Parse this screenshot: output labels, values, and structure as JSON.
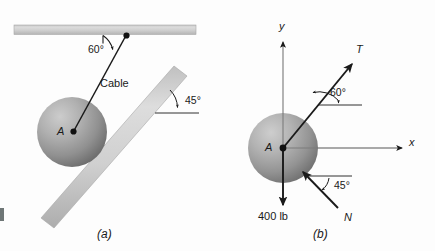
{
  "figure": {
    "background_color": "#fdfdfd",
    "ink_color": "#1a1a1a",
    "bar_fill_light": "#d8d8d8",
    "bar_fill_mid": "#bfbfbf",
    "sphere_light": "#c9c9c9",
    "sphere_mid": "#9a9a9a",
    "sphere_dark": "#6e6e6e",
    "captions": [
      {
        "label": "(a)",
        "x": 97,
        "y": 231
      },
      {
        "label": "(b)",
        "x": 313,
        "y": 231
      }
    ]
  },
  "panel_a": {
    "name": "space-diagram",
    "caption": "(a)",
    "point_label": "A",
    "cable_label": "Cable",
    "ceiling_angle_label": "60°",
    "incline_angle_label": "45°",
    "geometry": {
      "ceiling_x1": 14,
      "ceiling_x2": 196,
      "ceiling_y": 25,
      "ceiling_thickness": 9,
      "sphere_cx": 72,
      "sphere_cy": 132,
      "sphere_r": 35,
      "cable_attach_x": 126,
      "cable_attach_y": 35,
      "incline_angle_deg": 45
    }
  },
  "panel_b": {
    "name": "free-body-diagram",
    "caption": "(b)",
    "point_label": "A",
    "axis_y_label": "y",
    "axis_x_label": "x",
    "tension_label": "T",
    "normal_label": "N",
    "weight_label": "400 lb",
    "tension_angle_label": "60°",
    "normal_angle_label": "45°",
    "geometry": {
      "origin_x": 283,
      "origin_y": 148,
      "sphere_r": 35,
      "y_axis_top": 40,
      "x_axis_right": 404,
      "weight_arrow_bottom": 205,
      "tension_angle_deg": 60,
      "normal_angle_deg": 45
    },
    "forces": [
      {
        "symbol": "T",
        "direction_deg_from_x": 60,
        "sense": "away-from-A",
        "kind": "cable-tension"
      },
      {
        "symbol": "N",
        "direction_deg_from_x": 135,
        "sense": "toward-A",
        "kind": "surface-normal"
      },
      {
        "symbol": "400 lb",
        "direction_deg_from_x": 270,
        "sense": "away-from-A",
        "kind": "weight"
      }
    ]
  }
}
